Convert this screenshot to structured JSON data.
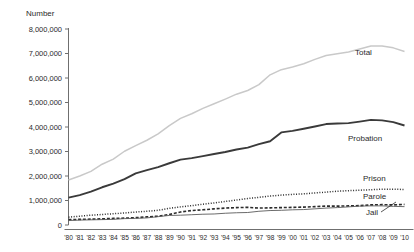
{
  "chart_data": {
    "type": "line",
    "title": "",
    "xlabel": "",
    "ylabel": "Number",
    "ylim": [
      0,
      8000000
    ],
    "xlim": [
      "'80",
      "'10"
    ],
    "grid": false,
    "legend_position": "inline-right-labels",
    "ytick_labels": [
      "8,000,000",
      "7,000,000",
      "6,000,000",
      "5,000,000",
      "4,000,000",
      "3,000,000",
      "2,000,000",
      "1,000,000",
      "0"
    ],
    "ytick_values": [
      8000000,
      7000000,
      6000000,
      5000000,
      4000000,
      3000000,
      2000000,
      1000000,
      0
    ],
    "categories": [
      "'80",
      "'81",
      "'82",
      "'83",
      "'84",
      "'85",
      "'86",
      "'87",
      "'88",
      "'89",
      "'90",
      "'91",
      "'92",
      "'93",
      "'94",
      "'95",
      "'96",
      "'97",
      "'98",
      "'99",
      "'00",
      "'01",
      "'02",
      "'03",
      "'04",
      "'05",
      "'06",
      "'07",
      "'08",
      "'09",
      "'10"
    ],
    "series": [
      {
        "name": "Total",
        "style": "solid-light",
        "color": "#c9c9c9",
        "label": "Total",
        "values": [
          1840000,
          2000000,
          2190000,
          2480000,
          2690000,
          3010000,
          3240000,
          3460000,
          3720000,
          4060000,
          4350000,
          4540000,
          4760000,
          4950000,
          5140000,
          5340000,
          5490000,
          5730000,
          6130000,
          6340000,
          6450000,
          6580000,
          6760000,
          6920000,
          6990000,
          7060000,
          7180000,
          7310000,
          7310000,
          7230000,
          7080000
        ]
      },
      {
        "name": "Probation",
        "style": "solid-dark",
        "color": "#3a3a3a",
        "label": "Probation",
        "values": [
          1120000,
          1220000,
          1360000,
          1540000,
          1690000,
          1870000,
          2110000,
          2240000,
          2360000,
          2520000,
          2670000,
          2730000,
          2810000,
          2900000,
          2980000,
          3080000,
          3160000,
          3300000,
          3420000,
          3780000,
          3840000,
          3930000,
          4020000,
          4120000,
          4140000,
          4160000,
          4220000,
          4290000,
          4270000,
          4200000,
          4060000
        ]
      },
      {
        "name": "Prison",
        "style": "dotted",
        "color": "#2b2b2b",
        "label": "Prison",
        "values": [
          320000,
          360000,
          400000,
          430000,
          460000,
          490000,
          530000,
          560000,
          600000,
          680000,
          740000,
          790000,
          850000,
          900000,
          960000,
          1020000,
          1080000,
          1130000,
          1180000,
          1220000,
          1250000,
          1270000,
          1310000,
          1340000,
          1380000,
          1400000,
          1420000,
          1440000,
          1460000,
          1460000,
          1450000
        ]
      },
      {
        "name": "Parole",
        "style": "dashed",
        "color": "#2b2b2b",
        "label": "Parole",
        "values": [
          220000,
          230000,
          240000,
          250000,
          270000,
          280000,
          300000,
          330000,
          360000,
          430000,
          530000,
          590000,
          620000,
          660000,
          690000,
          710000,
          720000,
          690000,
          700000,
          710000,
          720000,
          730000,
          750000,
          770000,
          770000,
          780000,
          790000,
          820000,
          830000,
          820000,
          840000
        ]
      },
      {
        "name": "Jail",
        "style": "solid-thin",
        "color": "#5a5a5a",
        "label": "Jail",
        "values": [
          180000,
          200000,
          210000,
          220000,
          230000,
          260000,
          270000,
          290000,
          340000,
          390000,
          400000,
          420000,
          440000,
          450000,
          480000,
          500000,
          510000,
          560000,
          590000,
          600000,
          620000,
          630000,
          660000,
          690000,
          710000,
          740000,
          770000,
          780000,
          780000,
          760000,
          750000
        ]
      }
    ]
  },
  "axis": {
    "y_title": "Number"
  }
}
